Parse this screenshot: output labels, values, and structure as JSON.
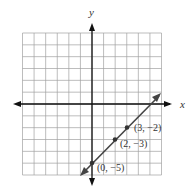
{
  "chart_data": {
    "type": "line",
    "title": "",
    "xlabel": "x",
    "ylabel": "y",
    "xlim": [
      -6,
      6
    ],
    "ylim": [
      -6,
      6
    ],
    "grid": true,
    "series": [
      {
        "name": "line",
        "equation": "y = x - 5",
        "x": [
          -1,
          6
        ],
        "values": [
          -6,
          1
        ],
        "color": "#444444"
      }
    ],
    "points": [
      {
        "x": 0,
        "y": -5,
        "label": "(0, −5)"
      },
      {
        "x": 2,
        "y": -3,
        "label": "(2, −3)"
      },
      {
        "x": 3,
        "y": -2,
        "label": "(3, −2)"
      }
    ]
  },
  "labels": {
    "x_axis": "x",
    "y_axis": "y",
    "p1": "(0, −5)",
    "p2": "(2, −3)",
    "p3": "(3, −2)"
  },
  "colors": {
    "grid": "#9a9a9a",
    "axis": "#111111",
    "line": "#444444"
  }
}
